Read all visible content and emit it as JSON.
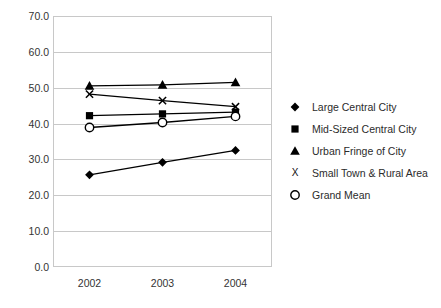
{
  "chart_data": {
    "type": "line",
    "title": "",
    "xlabel": "",
    "ylabel": "",
    "categories": [
      "2002",
      "2003",
      "2004"
    ],
    "ylim": [
      0.0,
      70.0
    ],
    "ytick_step": 10.0,
    "yticks": [
      "70.0",
      "60.0",
      "50.0",
      "40.0",
      "30.0",
      "20.0",
      "10.0",
      "0.0"
    ],
    "grid": "horizontal",
    "legend_position": "right",
    "series": [
      {
        "name": "Large Central City",
        "marker": "filled-diamond",
        "color": "#000000",
        "values": [
          25.7,
          29.2,
          32.5
        ]
      },
      {
        "name": "Mid-Sized Central City",
        "marker": "filled-square",
        "color": "#000000",
        "values": [
          42.2,
          42.7,
          43.2
        ]
      },
      {
        "name": "Urban Fringe of City",
        "marker": "filled-triangle",
        "color": "#000000",
        "values": [
          50.5,
          50.8,
          51.5
        ]
      },
      {
        "name": "Small Town & Rural Area",
        "marker": "x-cross",
        "color": "#000000",
        "values": [
          48.2,
          46.4,
          44.7
        ]
      },
      {
        "name": "Grand Mean",
        "marker": "open-circle",
        "color": "#000000",
        "values": [
          38.9,
          40.3,
          42.0
        ]
      }
    ]
  },
  "legend": {
    "items": [
      {
        "label": "Large Central City",
        "glyph": "◆",
        "marker": "filled-diamond"
      },
      {
        "label": "Mid-Sized Central City",
        "glyph": "■",
        "marker": "filled-square"
      },
      {
        "label": "Urban Fringe of City",
        "glyph": "▲",
        "marker": "filled-triangle"
      },
      {
        "label": "Small Town & Rural Area",
        "glyph": "X",
        "marker": "x-cross"
      },
      {
        "label": "Grand Mean",
        "glyph": "○",
        "marker": "open-circle"
      }
    ]
  },
  "colors": {
    "line": "#000000",
    "grid": "#c8c8c8",
    "frame": "#c8c8c8",
    "tick_text": "#333333",
    "legend_text": "#2b2b2b",
    "background": "#ffffff"
  }
}
